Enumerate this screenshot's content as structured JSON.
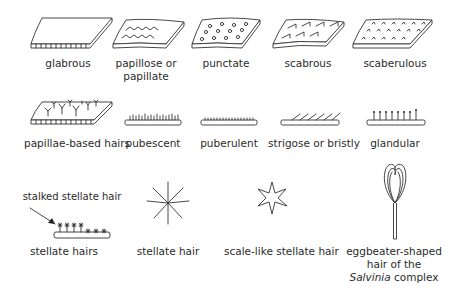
{
  "rows": [
    {
      "items": [
        {
          "id": "glabrous",
          "label": "glabrous",
          "icon": "glabrous-surface-icon"
        },
        {
          "id": "papillose",
          "label_line1": "papillose or",
          "label_line2": "papillate",
          "icon": "papillose-surface-icon"
        },
        {
          "id": "punctate",
          "label": "punctate",
          "icon": "punctate-surface-icon"
        },
        {
          "id": "scabrous",
          "label": "scabrous",
          "icon": "scabrous-surface-icon"
        },
        {
          "id": "scaberulous",
          "label": "scaberulous",
          "icon": "scaberulous-surface-icon"
        }
      ]
    },
    {
      "items": [
        {
          "id": "papillae-based-hairs",
          "label": "papillae-based hairs",
          "icon": "papillae-based-hairs-icon"
        },
        {
          "id": "pubescent",
          "label": "pubescent",
          "icon": "pubescent-hairs-icon"
        },
        {
          "id": "puberulent",
          "label": "puberulent",
          "icon": "puberulent-hairs-icon"
        },
        {
          "id": "strigose",
          "label": "strigose or bristly",
          "icon": "strigose-hairs-icon"
        },
        {
          "id": "glandular",
          "label": "glandular",
          "icon": "glandular-hairs-icon"
        }
      ]
    },
    {
      "items": [
        {
          "id": "stellate-hairs",
          "label": "stellate hairs",
          "callout": "stalked stellate hair",
          "icon": "stellate-hairs-icon"
        },
        {
          "id": "stellate-hair",
          "label": "stellate hair",
          "icon": "stellate-hair-icon"
        },
        {
          "id": "scale-like-stellate-hair",
          "label": "scale-like stellate hair",
          "icon": "scale-like-stellate-hair-icon"
        },
        {
          "id": "eggbeater",
          "label_line1": "eggbeater-shaped",
          "label_line2": "hair of the",
          "label_line3_italic": "Salvinia",
          "label_line3_rest": " complex",
          "icon": "eggbeater-hair-icon"
        }
      ]
    }
  ]
}
